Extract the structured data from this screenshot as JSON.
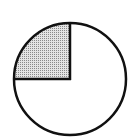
{
  "figure": {
    "type": "fraction-circle",
    "total_parts": 4,
    "shaded_parts": 1,
    "shaded_fraction": "1/4",
    "shaded_quadrant": "top-left",
    "colors": {
      "stroke": "#111111",
      "shade": "#c8c8c8",
      "background": "#ffffff"
    }
  }
}
